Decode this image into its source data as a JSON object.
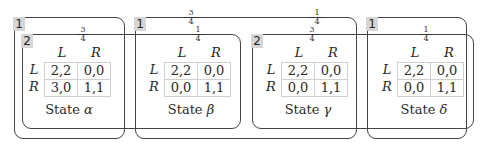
{
  "diagram": {
    "type": "information-set-game-diagram",
    "player1_sets": [
      {
        "label": "1",
        "states": [
          "alpha"
        ],
        "probabilities": []
      },
      {
        "label": "1",
        "states": [
          "beta",
          "gamma"
        ],
        "probabilities": [
          {
            "num": "3",
            "den": "4"
          },
          {
            "num": "1",
            "den": "4"
          }
        ]
      },
      {
        "label": "1",
        "states": [
          "delta"
        ],
        "probabilities": []
      }
    ],
    "player2_sets": [
      {
        "label": "2",
        "states": [
          "alpha",
          "beta"
        ],
        "probabilities": [
          {
            "num": "3",
            "den": "4"
          },
          {
            "num": "1",
            "den": "4"
          }
        ]
      },
      {
        "label": "2",
        "states": [
          "gamma",
          "delta"
        ],
        "probabilities": [
          {
            "num": "3",
            "den": "4"
          },
          {
            "num": "1",
            "den": "4"
          }
        ]
      }
    ],
    "states": [
      {
        "id": "alpha",
        "name": "State",
        "symbol": "α",
        "col_headers": [
          "L",
          "R"
        ],
        "row_headers": [
          "L",
          "R"
        ],
        "payoffs": [
          [
            "2,2",
            "0,0"
          ],
          [
            "3,0",
            "1,1"
          ]
        ]
      },
      {
        "id": "beta",
        "name": "State",
        "symbol": "β",
        "col_headers": [
          "L",
          "R"
        ],
        "row_headers": [
          "L",
          "R"
        ],
        "payoffs": [
          [
            "2,2",
            "0,0"
          ],
          [
            "0,0",
            "1,1"
          ]
        ]
      },
      {
        "id": "gamma",
        "name": "State",
        "symbol": "γ",
        "col_headers": [
          "L",
          "R"
        ],
        "row_headers": [
          "L",
          "R"
        ],
        "payoffs": [
          [
            "2,2",
            "0,0"
          ],
          [
            "0,0",
            "1,1"
          ]
        ]
      },
      {
        "id": "delta",
        "name": "State",
        "symbol": "δ",
        "col_headers": [
          "L",
          "R"
        ],
        "row_headers": [
          "L",
          "R"
        ],
        "payoffs": [
          [
            "2,2",
            "0,0"
          ],
          [
            "0,0",
            "1,1"
          ]
        ]
      }
    ]
  },
  "colors": {
    "border": "#444444",
    "label_bg": "#d6d6d6",
    "cell_border": "#cfcfcf"
  }
}
